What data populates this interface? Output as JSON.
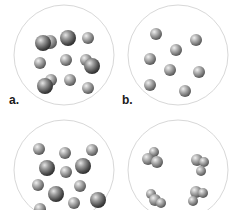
{
  "figure": {
    "type": "particle-diagrams",
    "colors": {
      "background": "#ffffff",
      "container_outline": "#d8d8d8",
      "particle_light": "#d0d0d0",
      "particle_mid": "#8a8a8a",
      "particle_dark": "#3a3a3a",
      "label": "#1a1a1a"
    },
    "panels": [
      {
        "id": "a",
        "label": "a.",
        "description": "Mixture of single atoms and diatomic molecules",
        "container": {
          "cx": 64,
          "cy": 55,
          "r": 50
        },
        "particles": [
          {
            "type": "diatomic",
            "atoms": [
              {
                "x": 50,
                "y": 42,
                "r": 7
              },
              {
                "x": 43,
                "y": 43,
                "r": 8
              }
            ]
          },
          {
            "type": "atom-large",
            "atoms": [
              {
                "x": 68,
                "y": 38,
                "r": 8
              }
            ]
          },
          {
            "type": "atom",
            "atoms": [
              {
                "x": 88,
                "y": 38,
                "r": 6
              }
            ]
          },
          {
            "type": "atom",
            "atoms": [
              {
                "x": 40,
                "y": 63,
                "r": 6
              }
            ]
          },
          {
            "type": "atom",
            "atoms": [
              {
                "x": 66,
                "y": 60,
                "r": 6
              }
            ]
          },
          {
            "type": "diatomic",
            "atoms": [
              {
                "x": 86,
                "y": 60,
                "r": 6
              },
              {
                "x": 92,
                "y": 66,
                "r": 8
              }
            ]
          },
          {
            "type": "diatomic",
            "atoms": [
              {
                "x": 51,
                "y": 80,
                "r": 6
              },
              {
                "x": 45,
                "y": 86,
                "r": 8
              }
            ]
          },
          {
            "type": "atom",
            "atoms": [
              {
                "x": 70,
                "y": 80,
                "r": 6
              }
            ]
          },
          {
            "type": "atom",
            "atoms": [
              {
                "x": 88,
                "y": 88,
                "r": 6
              }
            ]
          }
        ]
      },
      {
        "id": "b",
        "label": "b.",
        "description": "Single element of uniform atoms",
        "container": {
          "cx": 178,
          "cy": 55,
          "r": 50
        },
        "particles": [
          {
            "type": "atom",
            "atoms": [
              {
                "x": 156,
                "y": 34,
                "r": 6
              }
            ]
          },
          {
            "type": "atom",
            "atoms": [
              {
                "x": 196,
                "y": 40,
                "r": 6
              }
            ]
          },
          {
            "type": "atom",
            "atoms": [
              {
                "x": 176,
                "y": 50,
                "r": 6
              }
            ]
          },
          {
            "type": "atom",
            "atoms": [
              {
                "x": 150,
                "y": 59,
                "r": 6
              }
            ]
          },
          {
            "type": "atom",
            "atoms": [
              {
                "x": 170,
                "y": 70,
                "r": 6
              }
            ]
          },
          {
            "type": "atom",
            "atoms": [
              {
                "x": 199,
                "y": 72,
                "r": 6
              }
            ]
          },
          {
            "type": "atom",
            "atoms": [
              {
                "x": 150,
                "y": 85,
                "r": 6
              }
            ]
          },
          {
            "type": "atom",
            "atoms": [
              {
                "x": 185,
                "y": 91,
                "r": 6
              }
            ]
          }
        ]
      },
      {
        "id": "c",
        "label": "",
        "description": "Mixture of two kinds of atoms",
        "container": {
          "cx": 64,
          "cy": 170,
          "r": 50
        },
        "particles": [
          {
            "type": "atom",
            "atoms": [
              {
                "x": 39,
                "y": 149,
                "r": 6
              }
            ]
          },
          {
            "type": "atom",
            "atoms": [
              {
                "x": 65,
                "y": 153,
                "r": 6
              }
            ]
          },
          {
            "type": "atom",
            "atoms": [
              {
                "x": 92,
                "y": 150,
                "r": 6
              }
            ]
          },
          {
            "type": "atom-large",
            "atoms": [
              {
                "x": 47,
                "y": 168,
                "r": 8
              }
            ]
          },
          {
            "type": "atom",
            "atoms": [
              {
                "x": 66,
                "y": 172,
                "r": 6
              }
            ]
          },
          {
            "type": "atom-large",
            "atoms": [
              {
                "x": 83,
                "y": 166,
                "r": 8
              }
            ]
          },
          {
            "type": "atom",
            "atoms": [
              {
                "x": 38,
                "y": 185,
                "r": 6
              }
            ]
          },
          {
            "type": "atom",
            "atoms": [
              {
                "x": 80,
                "y": 186,
                "r": 6
              }
            ]
          },
          {
            "type": "atom-large",
            "atoms": [
              {
                "x": 56,
                "y": 194,
                "r": 8
              }
            ]
          },
          {
            "type": "atom",
            "atoms": [
              {
                "x": 74,
                "y": 203,
                "r": 6
              }
            ]
          },
          {
            "type": "atom-large",
            "atoms": [
              {
                "x": 98,
                "y": 200,
                "r": 8
              }
            ]
          },
          {
            "type": "atom",
            "atoms": [
              {
                "x": 40,
                "y": 209,
                "r": 6
              }
            ]
          }
        ]
      },
      {
        "id": "d",
        "label": "",
        "description": "Compound of polyatomic molecules",
        "container": {
          "cx": 178,
          "cy": 170,
          "r": 50
        },
        "particles": [
          {
            "type": "molecule",
            "atoms": [
              {
                "x": 154,
                "y": 152,
                "r": 5
              },
              {
                "x": 148,
                "y": 159,
                "r": 6
              },
              {
                "x": 157,
                "y": 162,
                "r": 6
              }
            ]
          },
          {
            "type": "molecule",
            "atoms": [
              {
                "x": 197,
                "y": 160,
                "r": 6
              },
              {
                "x": 204,
                "y": 162,
                "r": 5
              },
              {
                "x": 201,
                "y": 171,
                "r": 5
              }
            ]
          },
          {
            "type": "molecule",
            "atoms": [
              {
                "x": 151,
                "y": 194,
                "r": 5
              },
              {
                "x": 155,
                "y": 200,
                "r": 6
              },
              {
                "x": 161,
                "y": 203,
                "r": 5
              }
            ]
          },
          {
            "type": "molecule",
            "atoms": [
              {
                "x": 196,
                "y": 192,
                "r": 6
              },
              {
                "x": 203,
                "y": 193,
                "r": 5
              },
              {
                "x": 193,
                "y": 201,
                "r": 5
              }
            ]
          }
        ]
      }
    ]
  }
}
